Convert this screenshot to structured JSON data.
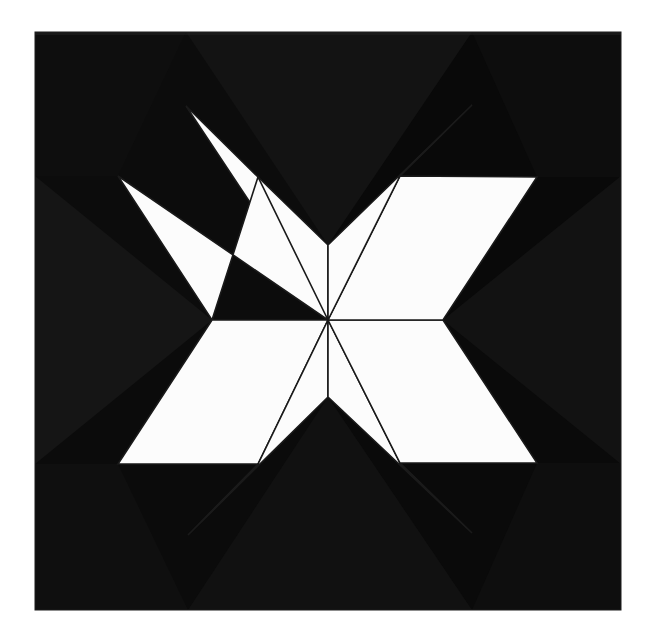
{
  "artwork": {
    "title": "Eight-Pointed Star Quilt Block",
    "medium": "photograph of pieced quilt block",
    "canvas": {
      "width": 647,
      "height": 638,
      "background_color": "#ffffff"
    }
  },
  "palette": {
    "background_white": "#ffffff",
    "block_black": "#0a0a0a",
    "block_black_shade_a": "#141414",
    "block_black_shade_b": "#101010",
    "block_black_shade_c": "#181818",
    "block_black_shade_d": "#0d0d0d",
    "star_white": "#fcfcfc",
    "seam_line": "#1a1a1a",
    "edge_shadow": "#2a2a2a"
  },
  "block": {
    "name": "black-square-ground",
    "x": 35,
    "y": 32,
    "width": 586,
    "height": 578
  },
  "star": {
    "name": "eight-pointed-star",
    "center": {
      "x": 328,
      "y": 320
    },
    "point_count": 8,
    "fill": "#fcfcfc",
    "seam_stroke": "#1a1a1a",
    "seam_width": 1.6,
    "outer_tips": [
      {
        "label": "tip-north-west-upper",
        "x": 186,
        "y": 106
      },
      {
        "label": "tip-north-east-upper",
        "x": 472,
        "y": 105
      },
      {
        "label": "tip-east-upper",
        "x": 537,
        "y": 177
      },
      {
        "label": "tip-east-lower",
        "x": 537,
        "y": 463
      },
      {
        "label": "tip-south-east-lower",
        "x": 472,
        "y": 533
      },
      {
        "label": "tip-south-west-lower",
        "x": 188,
        "y": 535
      },
      {
        "label": "tip-west-lower",
        "x": 118,
        "y": 464
      },
      {
        "label": "tip-west-upper",
        "x": 118,
        "y": 176
      }
    ],
    "inner_notches": [
      {
        "label": "notch-north",
        "x": 328,
        "y": 245
      },
      {
        "label": "notch-east",
        "x": 443,
        "y": 320
      },
      {
        "label": "notch-south",
        "x": 328,
        "y": 397
      },
      {
        "label": "notch-west",
        "x": 212,
        "y": 320
      }
    ],
    "arm_elbows": [
      {
        "label": "elbow-north-west",
        "x": 258,
        "y": 177
      },
      {
        "label": "elbow-north-east",
        "x": 400,
        "y": 176
      },
      {
        "label": "elbow-south-east",
        "x": 400,
        "y": 463
      },
      {
        "label": "elbow-south-west",
        "x": 258,
        "y": 464
      }
    ],
    "rhombi": [
      {
        "name": "rhombus-nnw",
        "points": "328,320 186,106 258,177 328,245"
      },
      {
        "name": "rhombus-wnw",
        "points": "328,320 118,176 212,320 258,177"
      },
      {
        "name": "rhombus-wsw",
        "points": "328,320 212,320 118,464 258,464"
      },
      {
        "name": "rhombus-ssw",
        "points": "328,320 258,464 188,535 328,397"
      },
      {
        "name": "rhombus-sse",
        "points": "328,320 328,397 472,533 400,463"
      },
      {
        "name": "rhombus-ese",
        "points": "328,320 400,463 537,463 443,320"
      },
      {
        "name": "rhombus-ene",
        "points": "328,320 443,320 537,177 400,176"
      },
      {
        "name": "rhombus-nne",
        "points": "328,320 400,176 472,105 328,245"
      }
    ]
  },
  "ground_shading": {
    "note": "subtle fabric tone variation in the black ground",
    "patches": [
      {
        "name": "ground-top-left-quadrant",
        "points": "35,32 328,32 328,320 35,320",
        "fill": "#0c0c0c"
      },
      {
        "name": "ground-top-right-quadrant",
        "points": "328,32 621,32 621,320 328,320",
        "fill": "#090909"
      },
      {
        "name": "ground-bottom-left-quadrant",
        "points": "35,320 328,320 328,610 35,610",
        "fill": "#0b0b0b"
      },
      {
        "name": "ground-bottom-right-quadrant",
        "points": "328,320 621,320 621,610 328,610",
        "fill": "#0a0a0a"
      },
      {
        "name": "ground-west-chevron-shade",
        "points": "35,176 212,320 35,464",
        "fill": "#151515"
      },
      {
        "name": "ground-east-chevron-shade",
        "points": "621,176 443,320 621,464",
        "fill": "#121212"
      },
      {
        "name": "ground-north-wedge-shade",
        "points": "186,32 328,245 472,32",
        "fill": "#131313"
      },
      {
        "name": "ground-south-wedge-shade",
        "points": "188,610 328,397 472,610",
        "fill": "#111111"
      },
      {
        "name": "ground-corner-tl-shade",
        "points": "35,32 186,32 118,176 35,176",
        "fill": "#0e0e0e"
      },
      {
        "name": "ground-corner-tr-shade",
        "points": "472,32 621,32 621,177 537,177",
        "fill": "#0d0d0d"
      },
      {
        "name": "ground-corner-bl-shade",
        "points": "35,464 118,464 188,610 35,610",
        "fill": "#0f0f0f"
      },
      {
        "name": "ground-corner-br-shade",
        "points": "537,463 621,463 621,610 472,610",
        "fill": "#0e0e0e"
      }
    ]
  },
  "edges": {
    "block_border_color": "#1c1c1c",
    "block_border_width": 1
  }
}
